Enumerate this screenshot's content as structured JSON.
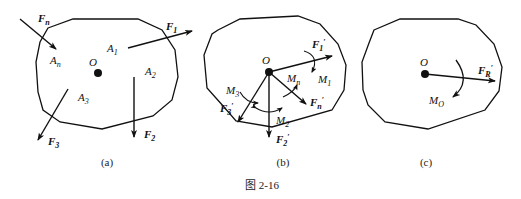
{
  "figure": {
    "caption": "图 2-16",
    "panels": [
      {
        "id": "a",
        "label": "(a)",
        "point": "O",
        "points": [
          "A1",
          "A2",
          "A3",
          "An"
        ],
        "forces": [
          "F1",
          "F2",
          "F3",
          "Fn"
        ],
        "text": {
          "O": "O",
          "A1": "A",
          "A1_sub": "1",
          "A2": "A",
          "A2_sub": "2",
          "A3": "A",
          "A3_sub": "3",
          "An": "A",
          "An_sub": "n",
          "F1": "F",
          "F1_sub": "1",
          "F2": "F",
          "F2_sub": "2",
          "F3": "F",
          "F3_sub": "3",
          "Fn": "F",
          "Fn_sub": "n"
        }
      },
      {
        "id": "b",
        "label": "(b)",
        "point": "O",
        "forces": [
          "F1'",
          "F2'",
          "F3'",
          "Fn'"
        ],
        "moments": [
          "M1",
          "M2",
          "M3",
          "Mn"
        ],
        "text": {
          "O": "O",
          "F1": "F",
          "F1_sub": "1",
          "F1_prime": "′",
          "F2": "F",
          "F2_sub": "2",
          "F2_prime": "′",
          "F3": "F",
          "F3_sub": "3",
          "F3_prime": "′",
          "Fn": "F",
          "Fn_sub": "n",
          "Fn_prime": "′",
          "M1": "M",
          "M1_sub": "1",
          "M2": "M",
          "M2_sub": "2",
          "M3": "M",
          "M3_sub": "3",
          "Mn": "M",
          "Mn_sub": "n"
        }
      },
      {
        "id": "c",
        "label": "(c)",
        "point": "O",
        "resultant_force": "FR'",
        "resultant_moment": "MO",
        "text": {
          "O": "O",
          "FR": "F",
          "FR_sub": "R",
          "FR_prime": "′",
          "MO": "M",
          "MO_sub": "O"
        }
      }
    ]
  }
}
